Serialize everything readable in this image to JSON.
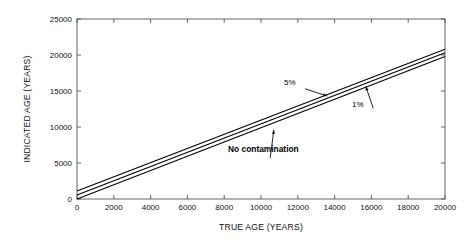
{
  "chart_data": {
    "type": "line",
    "title": "",
    "xlabel": "TRUE AGE (YEARS)",
    "ylabel": "INDICATED AGE (YEARS)",
    "xlim": [
      0,
      20000
    ],
    "ylim": [
      0,
      25000
    ],
    "xticks": [
      0,
      2000,
      4000,
      6000,
      8000,
      10000,
      12000,
      14000,
      16000,
      18000,
      20000
    ],
    "yticks": [
      0,
      5000,
      10000,
      15000,
      20000,
      25000
    ],
    "xtick_labels": [
      "0",
      "2000",
      "4000",
      "6000",
      "8000",
      "10000",
      "12000",
      "14000",
      "16000",
      "18000",
      "20000"
    ],
    "ytick_labels": [
      "0",
      "5000",
      "10000",
      "15000",
      "20000",
      "25000"
    ],
    "grid": false,
    "legend": "none",
    "line_color": "#000000",
    "series": [
      {
        "name": "No contamination",
        "x": [
          0,
          20000
        ],
        "values": [
          0,
          19800
        ],
        "label": "No contamination"
      },
      {
        "name": "1%",
        "x": [
          0,
          20000
        ],
        "values": [
          550,
          20300
        ],
        "label": "1%"
      },
      {
        "name": "5%",
        "x": [
          0,
          20000
        ],
        "values": [
          1100,
          20800
        ],
        "label": "5%"
      }
    ],
    "annotations": [
      {
        "text": "5%",
        "x": 12400,
        "y": 15300,
        "arrow_to_x": 13600,
        "arrow_to_y": 14300
      },
      {
        "text": "1%",
        "x": 16100,
        "y": 12600,
        "arrow_to_x": 15700,
        "arrow_to_y": 15600
      },
      {
        "text": "No contamination",
        "x": 10500,
        "y": 5700,
        "arrow_to_x": 10700,
        "arrow_to_y": 9600
      }
    ]
  },
  "axes": {
    "x_title": "TRUE AGE (YEARS)",
    "y_title": "INDICATED AGE (YEARS)"
  },
  "annotations": {
    "five_percent": "5%",
    "one_percent": "1%",
    "no_contamination": "No contamination"
  }
}
